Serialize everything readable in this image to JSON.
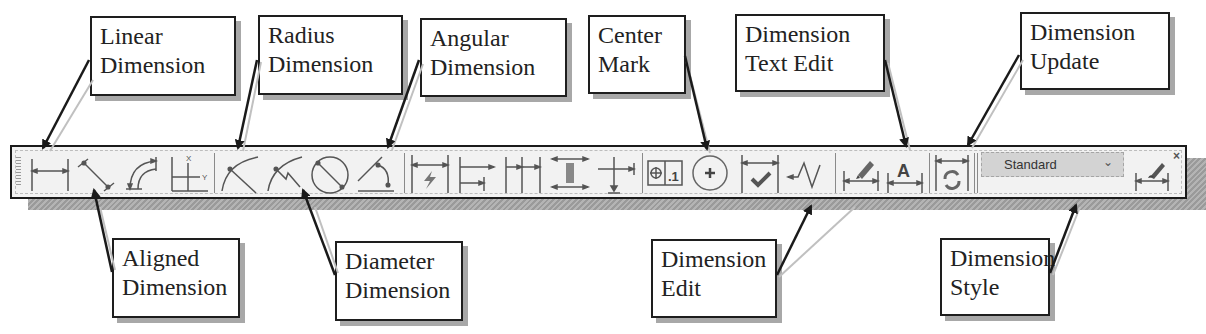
{
  "callouts_top": [
    {
      "id": "linear",
      "lines": [
        "Linear",
        "Dimension"
      ]
    },
    {
      "id": "radius",
      "lines": [
        "Radius",
        "Dimension"
      ]
    },
    {
      "id": "angular",
      "lines": [
        "Angular",
        "Dimension"
      ]
    },
    {
      "id": "center-mark",
      "lines": [
        "Center",
        "Mark"
      ]
    },
    {
      "id": "text-edit",
      "lines": [
        "Dimension",
        "Text Edit"
      ]
    },
    {
      "id": "update",
      "lines": [
        "Dimension",
        "Update"
      ]
    }
  ],
  "callouts_bottom": [
    {
      "id": "aligned",
      "lines": [
        "Aligned",
        "Dimension"
      ]
    },
    {
      "id": "diameter",
      "lines": [
        "Diameter",
        "Dimension"
      ]
    },
    {
      "id": "edit",
      "lines": [
        "Dimension",
        "Edit"
      ]
    },
    {
      "id": "style",
      "lines": [
        "Dimension",
        "Style"
      ]
    }
  ],
  "toolbar": {
    "tools": [
      {
        "name": "linear-dimension",
        "icon": "linear-dimension-icon"
      },
      {
        "name": "aligned-dimension",
        "icon": "aligned-dimension-icon"
      },
      {
        "name": "arc-length",
        "icon": "arc-length-icon"
      },
      {
        "name": "ordinate",
        "icon": "ordinate-icon"
      },
      {
        "name": "radius-dimension",
        "icon": "radius-icon"
      },
      {
        "name": "jogged",
        "icon": "jogged-radius-icon"
      },
      {
        "name": "diameter-dimension",
        "icon": "diameter-icon"
      },
      {
        "name": "angular-dimension",
        "icon": "angular-icon"
      },
      {
        "name": "quick-dimension",
        "icon": "quick-dimension-icon"
      },
      {
        "name": "baseline",
        "icon": "baseline-icon"
      },
      {
        "name": "continue",
        "icon": "continue-icon"
      },
      {
        "name": "space",
        "icon": "dimension-space-icon"
      },
      {
        "name": "break",
        "icon": "dimension-break-icon"
      },
      {
        "name": "tolerance",
        "icon": "tolerance-icon"
      },
      {
        "name": "center-mark",
        "icon": "center-mark-icon"
      },
      {
        "name": "inspection",
        "icon": "inspection-icon"
      },
      {
        "name": "jogged-linear",
        "icon": "jogged-linear-icon"
      },
      {
        "name": "dimension-edit",
        "icon": "dimension-edit-icon"
      },
      {
        "name": "dimension-text-edit",
        "icon": "dimension-text-edit-icon"
      },
      {
        "name": "dimension-update",
        "icon": "dimension-update-icon"
      },
      {
        "name": "dimension-style",
        "icon": "dimension-style-icon"
      }
    ],
    "style_select": {
      "value": "Standard",
      "chevron": "⌄"
    },
    "close_label": "×",
    "text_edit_glyph": "A",
    "tolerance_text": ".1"
  }
}
